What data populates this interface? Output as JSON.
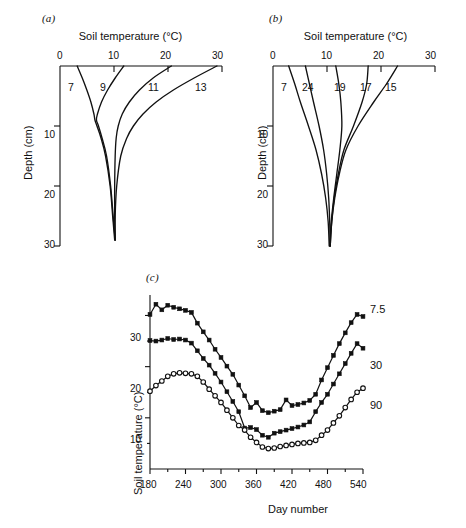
{
  "figure": {
    "background": "#ffffff",
    "ink": "#111111",
    "panels": [
      "a",
      "b",
      "c"
    ]
  },
  "panel_a": {
    "label": "(a)",
    "title": "Soil temperature (°C)",
    "ylabel": "Depth (cm)",
    "x_ticks": [
      "0",
      "10",
      "20",
      "30"
    ],
    "y_ticks": [
      "0",
      "10",
      "20",
      "30"
    ],
    "curve_labels": [
      "7",
      "9",
      "11",
      "13"
    ]
  },
  "panel_b": {
    "label": "(b)",
    "title": "Soil temperature (°C)",
    "ylabel": "Depth (cm)",
    "x_ticks": [
      "0",
      "10",
      "20",
      "30"
    ],
    "y_ticks": [
      "0",
      "10",
      "20",
      "30"
    ],
    "curve_labels": [
      "7",
      "24",
      "19",
      "17",
      "15"
    ]
  },
  "panel_c": {
    "label": "(c)",
    "ylabel": "Soil temperature (°C)",
    "xlabel": "Day number",
    "x_ticks": [
      "180",
      "240",
      "300",
      "360",
      "420",
      "480",
      "540"
    ],
    "y_ticks": [
      "10",
      "20",
      "30"
    ],
    "series_labels": [
      "7.5",
      "30",
      "90"
    ]
  },
  "chart_data": [
    {
      "type": "line",
      "panel": "a",
      "title": "Soil temperature (°C)",
      "xlabel": "Soil temperature (°C)",
      "ylabel": "Depth (cm)",
      "xlim": [
        0,
        32
      ],
      "ylim": [
        0,
        30
      ],
      "y_inverted": true,
      "grid": false,
      "legend": "inline-curve-labels",
      "x_ticks": [
        0,
        10,
        20,
        30
      ],
      "y_ticks": [
        0,
        10,
        20,
        30
      ],
      "series": [
        {
          "name": "7",
          "depth_cm": [
            0,
            2,
            4,
            6,
            8,
            9,
            10,
            12,
            15,
            20,
            25,
            29
          ],
          "temperature_c": [
            3.4,
            4.4,
            5.3,
            6.1,
            6.7,
            6.9,
            7.3,
            8.1,
            9.0,
            9.9,
            10.4,
            10.8
          ]
        },
        {
          "name": "9",
          "depth_cm": [
            0,
            2,
            4,
            6,
            8,
            9,
            10,
            12,
            15,
            20,
            25,
            29
          ],
          "temperature_c": [
            12.6,
            10.9,
            9.4,
            8.2,
            7.4,
            7.2,
            7.6,
            8.3,
            9.2,
            10.0,
            10.5,
            10.9
          ]
        },
        {
          "name": "11",
          "depth_cm": [
            0,
            2,
            4,
            6,
            8,
            10,
            12,
            15,
            20,
            25,
            29
          ],
          "temperature_c": [
            22.0,
            18.4,
            15.7,
            13.7,
            12.3,
            11.5,
            11.1,
            10.9,
            10.8,
            10.8,
            10.9
          ]
        },
        {
          "name": "13",
          "depth_cm": [
            0,
            2,
            4,
            6,
            8,
            10,
            12,
            15,
            20,
            25,
            29
          ],
          "temperature_c": [
            31.0,
            26.5,
            22.4,
            19.0,
            16.4,
            14.5,
            13.2,
            12.0,
            11.2,
            10.9,
            10.9
          ]
        }
      ]
    },
    {
      "type": "line",
      "panel": "b",
      "title": "Soil temperature (°C)",
      "xlabel": "Soil temperature (°C)",
      "ylabel": "Depth (cm)",
      "xlim": [
        0,
        32
      ],
      "ylim": [
        0,
        30
      ],
      "y_inverted": true,
      "grid": false,
      "legend": "inline-curve-labels",
      "x_ticks": [
        0,
        10,
        20,
        30
      ],
      "y_ticks": [
        0,
        10,
        20,
        30
      ],
      "series": [
        {
          "name": "7",
          "depth_cm": [
            0,
            3,
            6,
            10,
            14,
            18,
            22,
            26,
            30
          ],
          "temperature_c": [
            3.1,
            4.3,
            5.4,
            7.0,
            8.5,
            9.6,
            10.4,
            10.9,
            11.1
          ]
        },
        {
          "name": "24",
          "depth_cm": [
            0,
            3,
            6,
            10,
            14,
            18,
            22,
            26,
            30
          ],
          "temperature_c": [
            6.4,
            7.2,
            8.0,
            9.1,
            10.0,
            10.6,
            11.0,
            11.2,
            11.3
          ]
        },
        {
          "name": "19",
          "depth_cm": [
            0,
            3,
            6,
            10,
            14,
            18,
            22,
            26,
            30
          ],
          "temperature_c": [
            12.4,
            13.0,
            13.4,
            13.6,
            13.2,
            12.6,
            12.0,
            11.5,
            11.2
          ]
        },
        {
          "name": "17",
          "depth_cm": [
            0,
            3,
            6,
            10,
            14,
            18,
            22,
            26,
            30
          ],
          "temperature_c": [
            18.8,
            18.5,
            17.6,
            15.9,
            14.0,
            12.9,
            12.1,
            11.6,
            11.3
          ]
        },
        {
          "name": "15",
          "depth_cm": [
            0,
            3,
            6,
            10,
            14,
            18,
            22,
            26,
            30
          ],
          "temperature_c": [
            24.6,
            22.4,
            19.9,
            16.8,
            14.4,
            13.1,
            12.2,
            11.6,
            11.3
          ]
        }
      ]
    },
    {
      "type": "line",
      "panel": "c",
      "title": "",
      "xlabel": "Day number",
      "ylabel": "Soil temperature (°C)",
      "xlim": [
        175,
        545
      ],
      "ylim": [
        0,
        34
      ],
      "grid": false,
      "legend": "right-of-line-end",
      "x_ticks": [
        180,
        240,
        300,
        360,
        420,
        480,
        540
      ],
      "y_ticks": [
        10,
        20,
        30
      ],
      "series": [
        {
          "name": "7.5",
          "marker": "filled-square",
          "x": [
            180,
            190,
            200,
            210,
            220,
            230,
            240,
            250,
            260,
            270,
            280,
            290,
            300,
            310,
            320,
            330,
            340,
            350,
            360,
            370,
            380,
            390,
            400,
            410,
            420,
            430,
            440,
            450,
            460,
            470,
            480,
            490,
            500,
            510,
            520,
            530,
            540
          ],
          "y": [
            30.2,
            32.2,
            31.1,
            32.0,
            31.6,
            31.3,
            31.0,
            30.6,
            28.5,
            26.8,
            25.2,
            23.4,
            21.8,
            20.1,
            18.5,
            16.4,
            14.3,
            12.0,
            13.0,
            11.4,
            11.0,
            11.3,
            11.6,
            13.5,
            12.4,
            12.6,
            12.9,
            13.4,
            14.6,
            17.4,
            19.8,
            22.2,
            24.5,
            26.6,
            28.6,
            30.2,
            29.8
          ]
        },
        {
          "name": "30",
          "marker": "filled-square",
          "x": [
            180,
            190,
            200,
            210,
            220,
            230,
            240,
            250,
            260,
            270,
            280,
            290,
            300,
            310,
            320,
            330,
            340,
            350,
            360,
            370,
            380,
            390,
            400,
            410,
            420,
            430,
            440,
            450,
            460,
            470,
            480,
            490,
            500,
            510,
            520,
            530,
            540
          ],
          "y": [
            25.1,
            25.0,
            25.2,
            25.5,
            25.3,
            25.4,
            25.2,
            24.6,
            23.1,
            21.6,
            20.3,
            18.7,
            17.0,
            15.1,
            13.2,
            11.2,
            8.0,
            8.1,
            7.7,
            6.6,
            6.2,
            7.0,
            7.3,
            7.6,
            7.9,
            8.2,
            8.6,
            9.2,
            11.2,
            13.0,
            14.6,
            16.6,
            18.6,
            20.6,
            22.6,
            24.5,
            23.6
          ]
        },
        {
          "name": "90",
          "marker": "open-circle",
          "x": [
            180,
            190,
            200,
            210,
            220,
            230,
            240,
            250,
            260,
            270,
            280,
            290,
            300,
            310,
            320,
            330,
            340,
            350,
            360,
            370,
            380,
            390,
            400,
            410,
            420,
            430,
            440,
            450,
            460,
            470,
            480,
            490,
            500,
            510,
            520,
            530,
            540
          ],
          "y": [
            15.2,
            16.3,
            17.2,
            18.1,
            18.6,
            18.8,
            18.7,
            18.6,
            18.1,
            17.0,
            15.6,
            14.3,
            13.0,
            11.5,
            10.0,
            8.5,
            7.6,
            6.2,
            5.2,
            4.3,
            4.0,
            4.1,
            4.4,
            4.6,
            4.8,
            5.0,
            5.1,
            5.2,
            5.6,
            6.6,
            7.6,
            9.0,
            10.4,
            12.0,
            13.6,
            15.0,
            15.8
          ]
        }
      ]
    }
  ]
}
